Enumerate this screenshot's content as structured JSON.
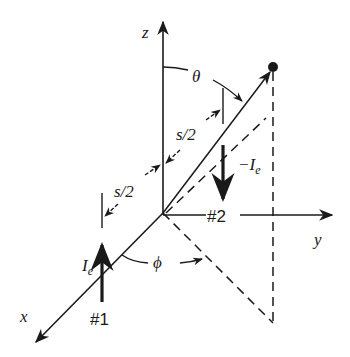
{
  "diagram": {
    "axes": {
      "z_label": "z",
      "y_label": "y",
      "x_label": "x"
    },
    "angles": {
      "theta": "θ",
      "phi": "ϕ"
    },
    "spacing": {
      "upper": "s/2",
      "lower": "s/2"
    },
    "dipoles": [
      {
        "id": "#1",
        "current_symbol": "I",
        "current_subscript": "e",
        "direction": "up"
      },
      {
        "id": "#2",
        "current_symbol": "−I",
        "current_subscript": "e",
        "direction": "down"
      }
    ],
    "colors": {
      "ink": "#1a1a1a",
      "background": "#ffffff"
    }
  }
}
